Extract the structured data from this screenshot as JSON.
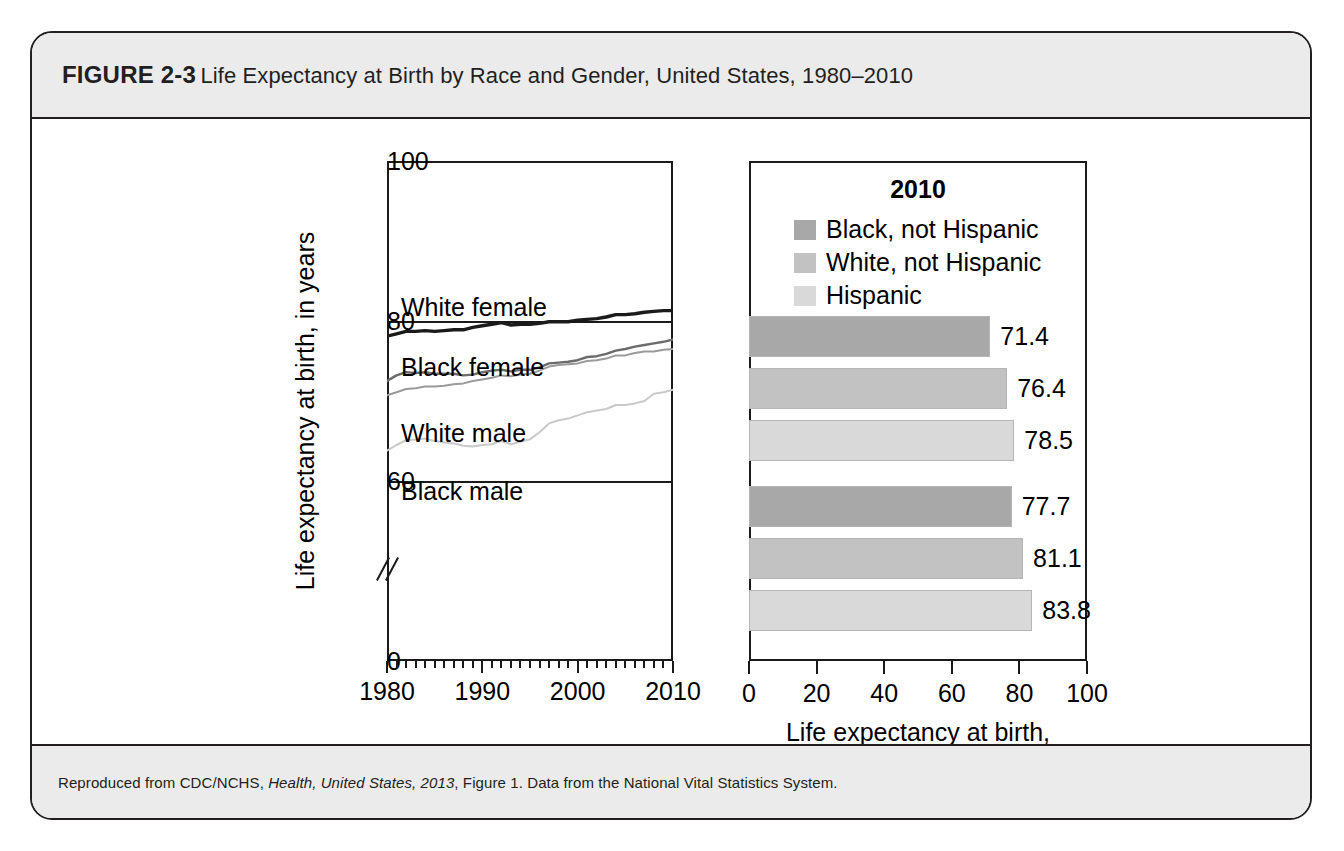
{
  "figure": {
    "label": "FIGURE 2-3",
    "title": "Life Expectancy at Birth by Race and Gender, United States, 1980–2010",
    "source_prefix": "Reproduced from CDC/NCHS, ",
    "source_italic": "Health, United States, 2013",
    "source_suffix": ", Figure 1. Data from the National Vital Statistics System.",
    "header_bg": "#ebebeb",
    "border_color": "#231f20"
  },
  "chart_data": [
    {
      "type": "line",
      "title": "",
      "xlabel": "",
      "ylabel": "Life expectancy at birth, in years",
      "xlim": [
        1980,
        2010
      ],
      "ylim": [
        0,
        100
      ],
      "y_break": true,
      "y_break_note": "axis broken between 0 and 60",
      "yticks": [
        0,
        60,
        80,
        100
      ],
      "xticks": [
        1980,
        1990,
        2000,
        2010
      ],
      "grid": false,
      "legend": "inline-labels",
      "x": [
        1980,
        1981,
        1982,
        1983,
        1984,
        1985,
        1986,
        1987,
        1988,
        1989,
        1990,
        1991,
        1992,
        1993,
        1994,
        1995,
        1996,
        1997,
        1998,
        1999,
        2000,
        2001,
        2002,
        2003,
        2004,
        2005,
        2006,
        2007,
        2008,
        2009,
        2010
      ],
      "series": [
        {
          "name": "White female",
          "color": "#1a1a1a",
          "values": [
            78.1,
            78.4,
            78.7,
            78.7,
            78.8,
            78.7,
            78.8,
            78.9,
            78.9,
            79.2,
            79.4,
            79.6,
            79.8,
            79.5,
            79.6,
            79.6,
            79.7,
            79.9,
            79.9,
            79.9,
            80.1,
            80.2,
            80.3,
            80.5,
            80.8,
            80.8,
            80.9,
            81.1,
            81.2,
            81.3,
            81.3
          ]
        },
        {
          "name": "Black female",
          "color": "#6b6b6b",
          "values": [
            72.5,
            73.2,
            73.6,
            73.5,
            73.6,
            73.4,
            73.4,
            73.4,
            73.2,
            73.3,
            73.6,
            73.8,
            73.9,
            73.7,
            73.9,
            73.9,
            74.2,
            74.7,
            74.8,
            74.9,
            75.1,
            75.5,
            75.6,
            75.9,
            76.3,
            76.5,
            76.8,
            77.0,
            77.2,
            77.4,
            77.7
          ]
        },
        {
          "name": "White male",
          "color": "#9a9a9a",
          "values": [
            70.7,
            71.1,
            71.5,
            71.6,
            71.8,
            71.8,
            71.9,
            72.1,
            72.2,
            72.5,
            72.7,
            72.9,
            73.2,
            73.1,
            73.3,
            73.4,
            73.8,
            74.3,
            74.5,
            74.6,
            74.7,
            75.0,
            75.1,
            75.3,
            75.7,
            75.7,
            76.0,
            76.2,
            76.2,
            76.4,
            76.5
          ]
        },
        {
          "name": "Black male",
          "color": "#c9c9c9",
          "values": [
            63.8,
            64.5,
            65.1,
            65.2,
            65.3,
            65.0,
            64.8,
            64.7,
            64.4,
            64.3,
            64.5,
            64.6,
            65.0,
            64.6,
            64.9,
            65.2,
            66.1,
            67.2,
            67.6,
            67.8,
            68.2,
            68.6,
            68.8,
            69.0,
            69.5,
            69.5,
            69.7,
            70.0,
            70.9,
            71.1,
            71.4
          ]
        }
      ],
      "series_label_positions": [
        {
          "label": "White female",
          "x_pct": 8,
          "y_px": 146
        },
        {
          "label": "Black female",
          "x_pct": 8,
          "y_px": 206
        },
        {
          "label": "White male",
          "x_pct": 8,
          "y_px": 272
        },
        {
          "label": "Black male",
          "x_pct": 8,
          "y_px": 330
        }
      ]
    },
    {
      "type": "bar",
      "orientation": "horizontal",
      "title": "2010",
      "xlabel": "Life expectancy at birth,\nin years",
      "xlabel_line1": "Life expectancy at birth,",
      "xlabel_line2": "in years",
      "ylabel": "",
      "xlim": [
        0,
        100
      ],
      "xticks": [
        0,
        20,
        40,
        60,
        80,
        100
      ],
      "grid": false,
      "legend_position": "top-center",
      "legend": [
        {
          "label": "Black, not Hispanic",
          "color": "#a8a8a8"
        },
        {
          "label": "White, not Hispanic",
          "color": "#c2c2c2"
        },
        {
          "label": "Hispanic",
          "color": "#d9d9d9"
        }
      ],
      "groups": [
        {
          "name": "Male",
          "categories": [
            "Black, not Hispanic",
            "White, not Hispanic",
            "Hispanic"
          ],
          "values": [
            71.4,
            76.4,
            78.5
          ],
          "labels": [
            "71.4",
            "76.4",
            "78.5"
          ]
        },
        {
          "name": "Female",
          "categories": [
            "Black, not Hispanic",
            "White, not Hispanic",
            "Hispanic"
          ],
          "values": [
            77.7,
            81.1,
            83.8
          ],
          "labels": [
            "77.7",
            "81.1",
            "83.8"
          ]
        }
      ]
    }
  ]
}
